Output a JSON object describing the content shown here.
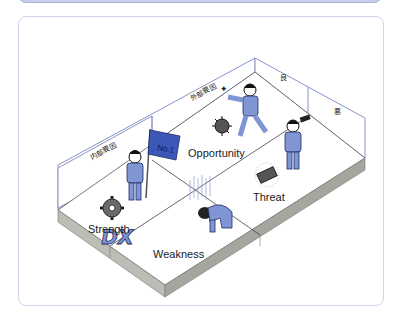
{
  "figure": {
    "quadrants": {
      "strength": "Strength",
      "weakness": "Weakness",
      "opportunity": "Opportunity",
      "threat": "Threat"
    },
    "wall_labels": {
      "internal_left": "内部要因",
      "external_back": "外部要因",
      "good": "良",
      "bad": "悪"
    },
    "flag_text": "No.1",
    "dx_text": "DX",
    "colors": {
      "suit": "#7f95d4",
      "suit_dark": "#3c4f9a",
      "flag": "#3b57b8",
      "wall_line": "#8a93c8",
      "platform_side": "#b8b8b0",
      "platform_side_dark": "#9c9c94",
      "card_border": "#cfd4ea"
    }
  }
}
